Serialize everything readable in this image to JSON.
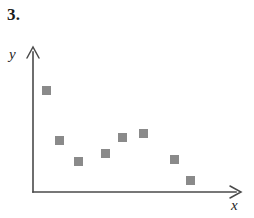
{
  "figure": {
    "problem_number": "3.",
    "y_axis_label": "y",
    "x_axis_label": "x",
    "marker_color": "#8a8a8a",
    "axis_color": "#4a4a4a",
    "background_color": "#ffffff"
  },
  "chart_data": {
    "type": "scatter",
    "title": "3.",
    "xlabel": "x",
    "ylabel": "y",
    "grid": false,
    "legend": null,
    "axis_style": "arrow-ended, unlabeled ticks",
    "xlim": [
      0,
      10
    ],
    "ylim": [
      0,
      10
    ],
    "series": [
      {
        "name": "points",
        "marker": "square",
        "color": "#8a8a8a",
        "points": [
          {
            "x": 1,
            "y": 7.5
          },
          {
            "x": 2,
            "y": 4.1
          },
          {
            "x": 3,
            "y": 2.6
          },
          {
            "x": 4.5,
            "y": 3.2
          },
          {
            "x": 5.5,
            "y": 4.3
          },
          {
            "x": 6.5,
            "y": 4.6
          },
          {
            "x": 8,
            "y": 2.8
          },
          {
            "x": 9,
            "y": 1.1
          }
        ]
      }
    ],
    "pixel_points": [
      {
        "cx": 46,
        "cy": 90
      },
      {
        "cx": 59,
        "cy": 140
      },
      {
        "cx": 78,
        "cy": 161
      },
      {
        "cx": 105,
        "cy": 153
      },
      {
        "cx": 122,
        "cy": 137
      },
      {
        "cx": 143,
        "cy": 133
      },
      {
        "cx": 174,
        "cy": 159
      },
      {
        "cx": 190,
        "cy": 180
      }
    ],
    "marker_size_px": 9,
    "axes_pixels": {
      "origin_x": 33,
      "origin_y": 192,
      "y_top": 47,
      "x_right": 241
    }
  }
}
